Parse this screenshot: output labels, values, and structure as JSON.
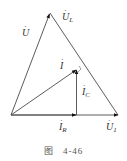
{
  "figure": {
    "caption_prefix": "图",
    "caption_number": "4-46"
  },
  "labels": {
    "U": {
      "base": "U",
      "sub": ""
    },
    "UL": {
      "base": "U",
      "sub": "L"
    },
    "I": {
      "base": "I",
      "sub": ""
    },
    "IC": {
      "base": "I",
      "sub": "C"
    },
    "IR": {
      "base": "I",
      "sub": "R"
    },
    "U1": {
      "base": "U",
      "sub": "1"
    }
  },
  "colors": {
    "line": "#4a4a4a",
    "arrow": "#111111",
    "text": "#333333"
  }
}
